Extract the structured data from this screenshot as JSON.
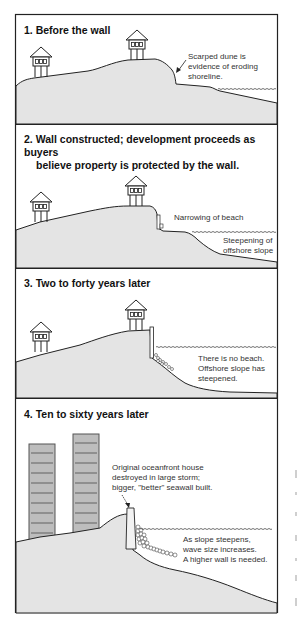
{
  "colors": {
    "ground_fill": "#e4e4e4",
    "outline": "#222222",
    "tower_fill": "#bdbdbd",
    "tower_band": "#8f8f8f"
  },
  "panels": [
    {
      "number": "1.",
      "title": "1.  Before the wall",
      "captions": [
        {
          "text": "Scarped dune is",
          "id": "c1a"
        },
        {
          "text": "evidence of eroding",
          "id": "c1b"
        },
        {
          "text": "shoreline.",
          "id": "c1c"
        }
      ]
    },
    {
      "number": "2.",
      "title_line1": "2.  Wall constructed; development proceeds as buyers",
      "title_line2": "believe property is protected by the wall.",
      "captions": [
        {
          "text": "Narrowing of beach"
        },
        {
          "text": "Steepening of"
        },
        {
          "text": "offshore slope"
        }
      ]
    },
    {
      "number": "3.",
      "title": "3.  Two to forty years later",
      "captions": [
        {
          "text": "There is no beach."
        },
        {
          "text": "Offshore slope has"
        },
        {
          "text": "steepened."
        }
      ]
    },
    {
      "number": "4.",
      "title": "4.  Ten to sixty years later",
      "captions": [
        {
          "text": "Original oceanfront house"
        },
        {
          "text": "destroyed in large storm;"
        },
        {
          "text": "bigger, \"better\" seawall built."
        },
        {
          "text": "As slope steepens,"
        },
        {
          "text": "wave size increases."
        },
        {
          "text": "A higher wall is needed."
        }
      ]
    }
  ]
}
